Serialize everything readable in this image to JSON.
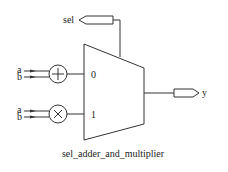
{
  "diagram": {
    "title": "sel_adder_and_multiplier",
    "ports": {
      "sel": "sel",
      "y": "y"
    },
    "adder": {
      "symbol": "plus-icon",
      "inputs": [
        "a",
        "b"
      ]
    },
    "multiplier": {
      "symbol": "times-icon",
      "inputs": [
        "a",
        "b"
      ]
    },
    "mux": {
      "input_labels": [
        "0",
        "1"
      ]
    },
    "colors": {
      "stroke": "#333333",
      "background": "#ffffff"
    }
  }
}
